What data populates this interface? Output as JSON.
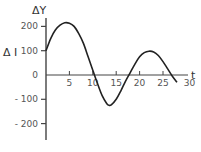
{
  "chart_data": {
    "type": "line",
    "title": "",
    "xlabel": "t",
    "ylabel": "ΔY",
    "side_label": "Δ I",
    "xlim": [
      0,
      30
    ],
    "ylim": [
      -250,
      250
    ],
    "grid": false,
    "x_ticks": [
      5,
      10,
      15,
      20,
      25,
      30
    ],
    "x_tick_labels": [
      "5",
      "10",
      "15",
      "20",
      "25",
      "30"
    ],
    "y_ticks": [
      200,
      100,
      0,
      -100,
      -200
    ],
    "y_tick_labels": [
      "200",
      "100",
      "0",
      "- 100",
      "- 200"
    ],
    "series": [
      {
        "name": "ΔY",
        "x": [
          0,
          1,
          2,
          3,
          4,
          5,
          6,
          7,
          8,
          9,
          10,
          11,
          12,
          13,
          13.5,
          14,
          15,
          16,
          17,
          18,
          19,
          20,
          21,
          22,
          23,
          24,
          25,
          26,
          27,
          28
        ],
        "values": [
          100,
          150,
          185,
          205,
          215,
          213,
          200,
          170,
          130,
          75,
          20,
          -35,
          -85,
          -118,
          -125,
          -122,
          -100,
          -65,
          -25,
          10,
          45,
          75,
          92,
          98,
          95,
          80,
          55,
          25,
          -5,
          -30
        ]
      }
    ]
  }
}
